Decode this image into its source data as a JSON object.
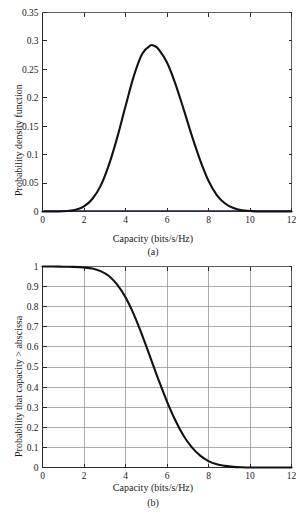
{
  "figure": {
    "name": "capacity-distribution-figure",
    "background_color": "#ffffff",
    "curve_color": "#111111",
    "grid_color": "#8a8a8a",
    "axis_color": "#2b2b2b"
  },
  "panel_a": {
    "subcaption": "(a)",
    "xlabel": "Capacity (bits/s/Hz)",
    "ylabel": "Probability density function",
    "xticks": [
      "0",
      "2",
      "4",
      "6",
      "8",
      "10",
      "12"
    ],
    "yticks": [
      "0",
      "0.05",
      "0.1",
      "0.15",
      "0.2",
      "0.25",
      "0.3",
      "0.35"
    ]
  },
  "panel_b": {
    "subcaption": "(b)",
    "xlabel": "Capacity (bits/s/Hz)",
    "ylabel": "Probability that capacity > abscissa",
    "xticks": [
      "0",
      "2",
      "4",
      "6",
      "8",
      "10",
      "12"
    ],
    "yticks": [
      "0",
      "0.1",
      "0.2",
      "0.3",
      "0.4",
      "0.5",
      "0.6",
      "0.7",
      "0.8",
      "0.9",
      "1"
    ]
  },
  "chart_data": [
    {
      "type": "line",
      "id": "panel-a-pdf",
      "title": "",
      "subcaption": "(a)",
      "xlabel": "Capacity (bits/s/Hz)",
      "ylabel": "Probability density function",
      "xlim": [
        0,
        12
      ],
      "ylim": [
        0,
        0.35
      ],
      "xticks": [
        0,
        2,
        4,
        6,
        8,
        10,
        12
      ],
      "yticks": [
        0,
        0.05,
        0.1,
        0.15,
        0.2,
        0.25,
        0.3,
        0.35
      ],
      "grid": false,
      "legend": null,
      "series": [
        {
          "name": "Probability density function",
          "color": "#111111",
          "x": [
            0.0,
            0.4,
            0.8,
            1.2,
            1.6,
            2.0,
            2.4,
            2.8,
            3.2,
            3.6,
            4.0,
            4.4,
            4.8,
            5.2,
            5.4,
            5.6,
            6.0,
            6.4,
            6.8,
            7.2,
            7.6,
            8.0,
            8.4,
            8.8,
            9.2,
            9.6,
            10.0,
            10.4,
            11.0,
            12.0
          ],
          "y": [
            0.0,
            0.0,
            0.0,
            0.001,
            0.003,
            0.009,
            0.022,
            0.045,
            0.082,
            0.13,
            0.185,
            0.238,
            0.277,
            0.292,
            0.291,
            0.285,
            0.262,
            0.225,
            0.18,
            0.133,
            0.09,
            0.054,
            0.029,
            0.014,
            0.006,
            0.002,
            0.001,
            0.0,
            0.0,
            0.0
          ]
        }
      ]
    },
    {
      "type": "line",
      "id": "panel-b-ccdf",
      "title": "",
      "subcaption": "(b)",
      "xlabel": "Capacity (bits/s/Hz)",
      "ylabel": "Probability that capacity > abscissa",
      "xlim": [
        0,
        12
      ],
      "ylim": [
        0,
        1
      ],
      "xticks": [
        0,
        2,
        4,
        6,
        8,
        10,
        12
      ],
      "yticks": [
        0,
        0.1,
        0.2,
        0.3,
        0.4,
        0.5,
        0.6,
        0.7,
        0.8,
        0.9,
        1.0
      ],
      "grid": true,
      "legend": null,
      "series": [
        {
          "name": "Probability that capacity > abscissa",
          "color": "#111111",
          "x": [
            0.0,
            0.5,
            1.0,
            1.5,
            2.0,
            2.4,
            2.8,
            3.2,
            3.6,
            4.0,
            4.4,
            4.8,
            5.2,
            5.6,
            6.0,
            6.4,
            6.8,
            7.2,
            7.6,
            8.0,
            8.4,
            8.8,
            9.2,
            9.6,
            10.0,
            10.5,
            11.0,
            11.5,
            12.0
          ],
          "y": [
            1.0,
            1.0,
            0.999,
            0.998,
            0.995,
            0.99,
            0.977,
            0.953,
            0.91,
            0.847,
            0.762,
            0.659,
            0.547,
            0.434,
            0.328,
            0.235,
            0.158,
            0.1,
            0.059,
            0.032,
            0.016,
            0.008,
            0.003,
            0.001,
            0.0,
            0.0,
            0.0,
            0.0,
            0.0
          ]
        }
      ]
    }
  ]
}
